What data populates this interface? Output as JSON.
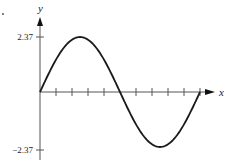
{
  "chart_data": {
    "type": "line",
    "title": "",
    "xlabel": "x",
    "ylabel": "y",
    "function": "y = 2.37 sin(x)",
    "amplitude": 2.37,
    "x_range_periods": [
      0,
      1
    ],
    "ylim": [
      -2.37,
      2.37
    ],
    "ytick_labels": [
      "2.37",
      "−2.37"
    ],
    "ytick_values": [
      2.37,
      -2.37
    ],
    "x_tick_count_per_period": 10,
    "series": [
      {
        "name": "sine curve",
        "values_description": "one full period of a sine wave starting at the origin, maximum 2.37 at quarter period, minimum -2.37 at three-quarter period"
      }
    ],
    "grid": false,
    "legend": "none"
  },
  "labels": {
    "x_axis": "x",
    "y_axis": "y",
    "ytick_top": "2.37",
    "ytick_bottom": "−2.37"
  }
}
